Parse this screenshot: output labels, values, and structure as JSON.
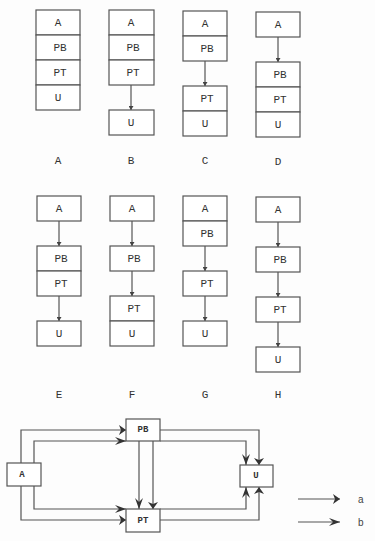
{
  "configurations": [
    {
      "caption": "A",
      "groups": [
        [
          "A",
          "PB",
          "PT",
          "U"
        ]
      ]
    },
    {
      "caption": "B",
      "groups": [
        [
          "A",
          "PB",
          "PT"
        ],
        [
          "U"
        ]
      ]
    },
    {
      "caption": "C",
      "groups": [
        [
          "A",
          "PB"
        ],
        [
          "PT",
          "U"
        ]
      ]
    },
    {
      "caption": "D",
      "groups": [
        [
          "A"
        ],
        [
          "PB",
          "PT",
          "U"
        ]
      ]
    },
    {
      "caption": "E",
      "groups": [
        [
          "A"
        ],
        [
          "PB",
          "PT"
        ],
        [
          "U"
        ]
      ]
    },
    {
      "caption": "F",
      "groups": [
        [
          "A"
        ],
        [
          "PB"
        ],
        [
          "PT",
          "U"
        ]
      ]
    },
    {
      "caption": "G",
      "groups": [
        [
          "A",
          "PB"
        ],
        [
          "PT"
        ],
        [
          "U"
        ]
      ]
    },
    {
      "caption": "H",
      "groups": [
        [
          "A"
        ],
        [
          "PB"
        ],
        [
          "PT"
        ],
        [
          "U"
        ]
      ]
    }
  ],
  "graph": {
    "nodes": [
      "A",
      "PB",
      "PT",
      "U"
    ],
    "edges": [
      {
        "from": "A",
        "to": "PB",
        "type": "a"
      },
      {
        "from": "A",
        "to": "PB",
        "type": "b"
      },
      {
        "from": "A",
        "to": "PT",
        "type": "b"
      },
      {
        "from": "A",
        "to": "PT",
        "type": "a"
      },
      {
        "from": "PB",
        "to": "PT",
        "type": "b"
      },
      {
        "from": "PB",
        "to": "PT",
        "type": "a"
      },
      {
        "from": "PB",
        "to": "U",
        "type": "a"
      },
      {
        "from": "PB",
        "to": "U",
        "type": "b"
      },
      {
        "from": "PT",
        "to": "U",
        "type": "b"
      },
      {
        "from": "PT",
        "to": "U",
        "type": "a"
      }
    ]
  },
  "legend": [
    {
      "label": "a",
      "arrow": "triangle-head"
    },
    {
      "label": "b",
      "arrow": "barbed-head"
    }
  ],
  "colors": {
    "line": "#555555",
    "text": "#333333",
    "background": "#fdfdfd"
  }
}
